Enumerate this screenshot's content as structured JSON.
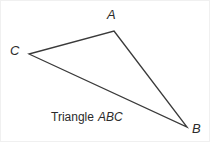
{
  "figure": {
    "caption_word": "Triangle",
    "caption_name": "ABC",
    "background_color": "#ffffff",
    "stroke_color": "#3a3a3a",
    "label_color": "#2b2b2b",
    "border_color": "#f0f0f0",
    "stroke_width": 1.3,
    "width": 210,
    "height": 142
  },
  "vertices": [
    {
      "label": "A",
      "x": 113,
      "y": 30
    },
    {
      "label": "B",
      "x": 186,
      "y": 126
    },
    {
      "label": "C",
      "x": 28,
      "y": 53
    }
  ],
  "edges": [
    {
      "name": "CA",
      "from": "C",
      "to": "A"
    },
    {
      "name": "AB",
      "from": "A",
      "to": "B"
    },
    {
      "name": "CB",
      "from": "C",
      "to": "B"
    }
  ]
}
